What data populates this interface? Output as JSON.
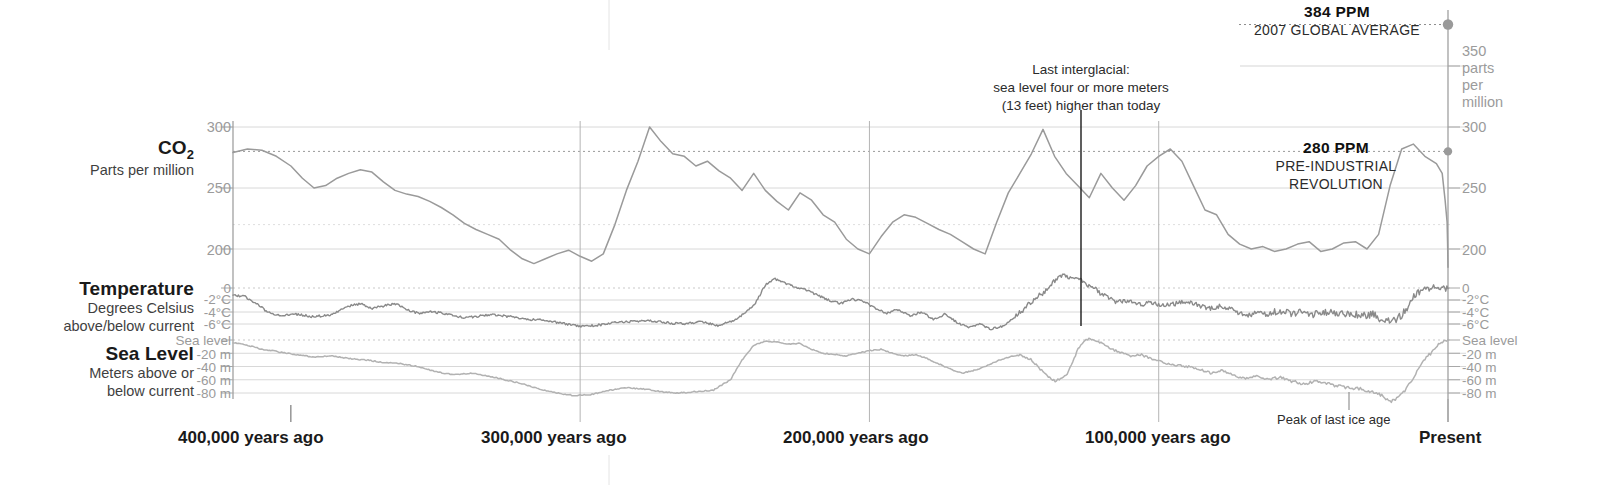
{
  "chart_data": {
    "type": "line",
    "xlabel": "",
    "ylabel": "",
    "grid": true,
    "legend_position": "none",
    "x_axis": {
      "ticks": [
        {
          "label": "400,000 years ago",
          "value": 400000
        },
        {
          "label": "300,000 years ago",
          "value": 300000
        },
        {
          "label": "200,000 years ago",
          "value": 200000
        },
        {
          "label": "100,000 years ago",
          "value": 100000
        },
        {
          "label": "Present",
          "value": 0
        }
      ],
      "range": [
        420000,
        0
      ]
    },
    "panels": [
      {
        "key": "co2",
        "title": "CO₂",
        "subtitle": "Parts per million",
        "unit": "ppm",
        "ylim": [
          170,
          390
        ],
        "left_ticks": [
          "300",
          "250",
          "200"
        ],
        "right_ticks": [
          "350\nparts\nper\nmillion",
          "300",
          "250",
          "200"
        ],
        "right_tick_values": [
          350,
          300,
          250,
          200
        ],
        "left_tick_values": [
          300,
          250,
          200
        ],
        "reference_lines": [
          {
            "value": 384,
            "label": "384 PPM",
            "sublabel": "2007 GLOBAL AVERAGE",
            "style": "dotted"
          },
          {
            "value": 280,
            "label": "280 PPM",
            "sublabel": "PRE-INDUSTRIAL REVOLUTION",
            "style": "dotted"
          }
        ],
        "series_color": "#9a9a9a",
        "x": [
          420,
          415,
          410,
          405,
          400,
          396,
          392,
          388,
          384,
          380,
          376,
          372,
          368,
          364,
          360,
          356,
          352,
          348,
          344,
          340,
          336,
          332,
          328,
          324,
          320,
          316,
          312,
          308,
          304,
          300,
          296,
          292,
          288,
          284,
          280,
          276,
          272,
          268,
          264,
          260,
          256,
          252,
          248,
          244,
          240,
          236,
          232,
          228,
          224,
          220,
          216,
          212,
          208,
          204,
          200,
          196,
          192,
          188,
          184,
          180,
          176,
          172,
          168,
          164,
          160,
          156,
          152,
          148,
          144,
          140,
          136,
          132,
          128,
          124,
          120,
          116,
          112,
          108,
          104,
          100,
          96,
          92,
          88,
          84,
          80,
          76,
          72,
          68,
          64,
          60,
          56,
          52,
          48,
          44,
          40,
          36,
          32,
          28,
          24,
          20,
          16,
          12,
          8,
          4,
          2,
          1,
          0.3,
          0.15,
          0.05,
          0
        ],
        "y": [
          279,
          282,
          281,
          276,
          268,
          258,
          250,
          252,
          258,
          262,
          265,
          263,
          255,
          248,
          245,
          243,
          239,
          234,
          228,
          221,
          216,
          212,
          208,
          199,
          192,
          188,
          192,
          196,
          199,
          194,
          190,
          196,
          220,
          248,
          272,
          300,
          288,
          278,
          276,
          268,
          272,
          264,
          258,
          248,
          262,
          248,
          239,
          232,
          246,
          240,
          228,
          222,
          208,
          200,
          196,
          210,
          222,
          228,
          226,
          221,
          216,
          212,
          206,
          200,
          196,
          222,
          246,
          262,
          278,
          298,
          276,
          262,
          252,
          242,
          262,
          250,
          240,
          252,
          268,
          276,
          282,
          272,
          252,
          232,
          228,
          212,
          204,
          200,
          202,
          198,
          200,
          204,
          206,
          198,
          200,
          205,
          206,
          200,
          212,
          252,
          282,
          286,
          276,
          270,
          262,
          240,
          222,
          204,
          190,
          185
        ]
      },
      {
        "key": "temperature",
        "title": "Temperature",
        "subtitle": "Degrees Celsius above/below current",
        "unit": "°C",
        "ylim": [
          -10.5,
          3.5
        ],
        "left_ticks": [
          "0",
          "-2°C",
          "-4°C",
          "-6°C"
        ],
        "right_ticks": [
          "0",
          "-2°C",
          "-4°C",
          "-6°C"
        ],
        "tick_values": [
          0,
          -2,
          -4,
          -6
        ],
        "series_color": "#8a8a8a"
      },
      {
        "key": "sea_level",
        "title": "Sea Level",
        "subtitle": "Meters above or below current",
        "unit": "m",
        "ylim": [
          -100,
          12
        ],
        "left_ticks": [
          "Sea level",
          "-20 m",
          "-40 m",
          "-60 m",
          "-80 m"
        ],
        "right_ticks": [
          "Sea level",
          "-20 m",
          "-40 m",
          "-60 m",
          "-80 m"
        ],
        "tick_values": [
          0,
          -20,
          -40,
          -60,
          -80
        ],
        "series_color": "#b2b2b2"
      }
    ],
    "annotations": [
      {
        "name": "last-interglacial",
        "lines": [
          "Last interglacial:",
          "sea level four or more meters",
          "(13 feet) higher than today"
        ],
        "x_value": 125000,
        "pointer": true
      },
      {
        "name": "peak-of-last-ice-age",
        "lines": [
          "Peak of last ice age"
        ],
        "x_value": 20000,
        "pointer": true
      }
    ],
    "markers": [
      {
        "name": "co2-2007-marker",
        "value": 384,
        "kind": "dot"
      },
      {
        "name": "co2-preindustrial-marker",
        "value": 280,
        "kind": "dot"
      }
    ],
    "colors": {
      "co2": "#9a9a9a",
      "temperature": "#8a8a8a",
      "sea_level": "#b2b2b2",
      "grid": "#d8d8d8",
      "grid_dotted": "#cfcfcf",
      "axis": "#8f8f8f",
      "pointer": "#1a1a1a",
      "tick_text": "#9b9b9b",
      "title_text": "#1a1a1a"
    }
  },
  "labels": {
    "co2_title": "CO",
    "co2_sub_digit": "2",
    "co2_subtitle": "Parts per million",
    "temperature_title": "Temperature",
    "temperature_sub1": "Degrees Celsius",
    "temperature_sub2": "above/below current",
    "sealevel_title": "Sea Level",
    "sealevel_sub1": "Meters above or",
    "sealevel_sub2": "below current",
    "ppm384": "384 PPM",
    "ppm384_sub": "2007 GLOBAL AVERAGE",
    "ppm280": "280 PPM",
    "ppm280_sub1": "PRE-INDUSTRIAL",
    "ppm280_sub2": "REVOLUTION",
    "interglacial1": "Last interglacial:",
    "interglacial2": "sea level four or more meters",
    "interglacial3": "(13 feet) higher than today",
    "peak_ice_age": "Peak of last ice age",
    "x1": "400,000 years ago",
    "x2": "300,000 years ago",
    "x3": "200,000 years ago",
    "x4": "100,000 years ago",
    "x5": "Present",
    "t_co2_300": "300",
    "t_co2_250": "250",
    "t_co2_200": "200",
    "t_co2_350": "350",
    "t_parts": "parts",
    "t_per": "per",
    "t_million": "million",
    "t_t0": "0",
    "t_t2": "-2°C",
    "t_t4": "-4°C",
    "t_t6": "-6°C",
    "t_s0": "Sea level",
    "t_s20": "-20 m",
    "t_s40": "-40 m",
    "t_s60": "-60 m",
    "t_s80": "-80 m"
  }
}
